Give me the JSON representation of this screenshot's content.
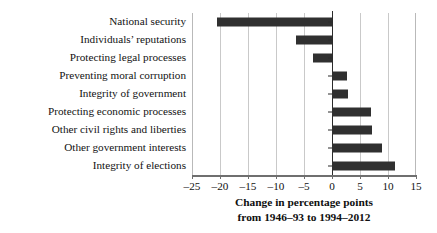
{
  "chart_data": {
    "type": "bar",
    "orientation": "horizontal",
    "title": "",
    "xlabel_line1": "Change in percentage points",
    "xlabel_line2": "from 1946–93 to 1994–2012",
    "ylabel": "",
    "categories": [
      "National security",
      "Individuals’ reputations",
      "Protecting legal processes",
      "Preventing moral corruption",
      "Integrity of government",
      "Protecting economic processes",
      "Other civil rights and liberties",
      "Other government interests",
      "Integrity of elections"
    ],
    "values": [
      -20.5,
      -6.4,
      -3.4,
      2.6,
      2.9,
      6.9,
      7.1,
      9.0,
      11.3
    ],
    "xlim": [
      -25,
      15
    ],
    "xticks": [
      -25,
      -20,
      -15,
      -10,
      -5,
      0,
      5,
      10,
      15
    ],
    "xticklabels": [
      "–25",
      "–20",
      "–15",
      "–10",
      "–5",
      "0",
      "5",
      "10",
      "15"
    ],
    "gridlines": [
      -20,
      -15,
      -10,
      -5,
      5,
      10
    ],
    "grid": true,
    "legend": "none",
    "bar_color": "#303030",
    "grid_color": "#c9c9c9",
    "axis_color": "#6f6f6f"
  }
}
